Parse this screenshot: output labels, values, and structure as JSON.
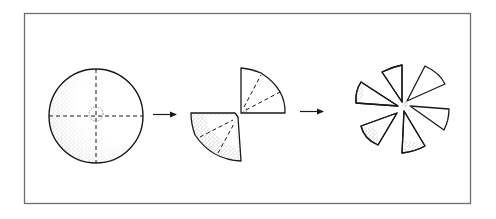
{
  "figure": {
    "frame": {
      "x": 24,
      "y": 13,
      "width": 447,
      "height": 191,
      "stroke": "#6e6e6e"
    },
    "colors": {
      "ink": "#1a1a1a",
      "stipple": "#555555",
      "background": "#ffffff"
    },
    "steps": [
      {
        "id": "step-1",
        "label": "Whole disc with dashed cross lines and stippled centre circle",
        "shape": "disc"
      },
      {
        "id": "step-2",
        "label": "Two quarter-circle pieces with dashed radial fold lines",
        "shape": "quarters"
      },
      {
        "id": "step-3",
        "label": "Six-bladed pinwheel arrangement",
        "shape": "pinwheel"
      }
    ],
    "arrows": [
      {
        "id": "arrow-1",
        "from": "step-1",
        "to": "step-2",
        "glyph": "→"
      },
      {
        "id": "arrow-2",
        "from": "step-2",
        "to": "step-3",
        "glyph": "→"
      }
    ]
  }
}
